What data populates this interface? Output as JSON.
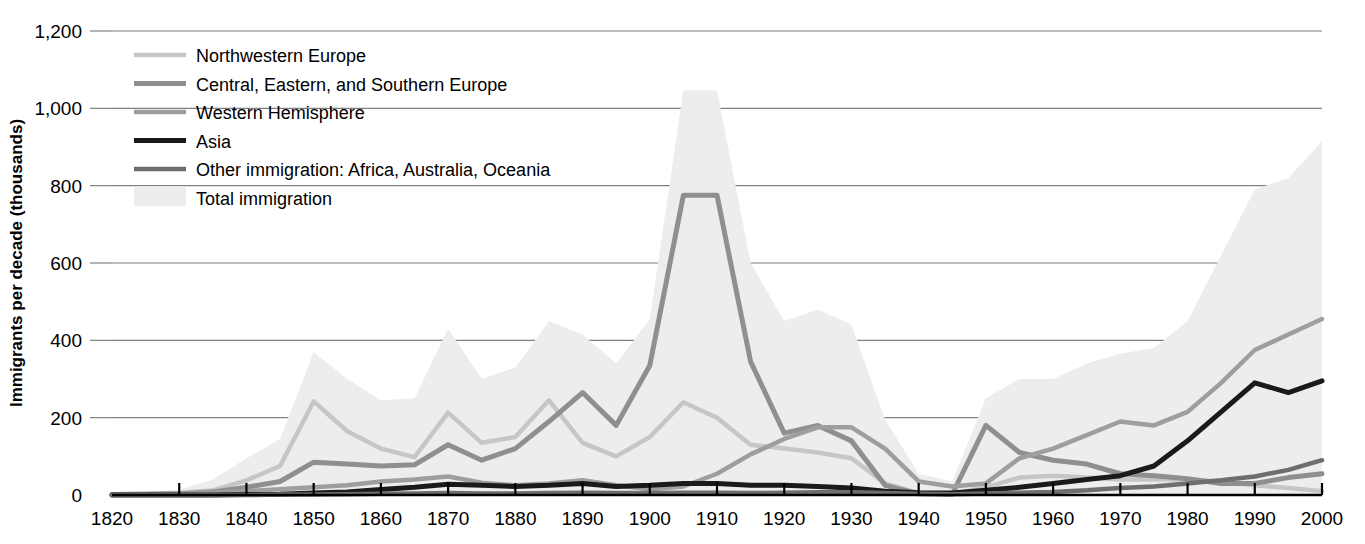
{
  "chart_data": {
    "type": "area",
    "title": "",
    "xlabel": "",
    "ylabel": "Immigrants per decade (thousands)",
    "xlim": [
      1820,
      2000
    ],
    "ylim": [
      0,
      1200
    ],
    "grid": true,
    "legend_position": "top-left",
    "xticks": [
      "1820",
      "1830",
      "1840",
      "1850",
      "1860",
      "1870",
      "1880",
      "1890",
      "1900",
      "1910",
      "1920",
      "1930",
      "1940",
      "1950",
      "1960",
      "1970",
      "1980",
      "1990",
      "2000"
    ],
    "yticks": [
      "0",
      "200",
      "400",
      "600",
      "800",
      "1,000",
      "1,200"
    ],
    "ytick_values": [
      0,
      200,
      400,
      600,
      800,
      1000,
      1200
    ],
    "x": [
      1820,
      1825,
      1830,
      1835,
      1840,
      1845,
      1850,
      1855,
      1860,
      1865,
      1870,
      1875,
      1880,
      1885,
      1890,
      1895,
      1900,
      1905,
      1910,
      1915,
      1920,
      1925,
      1930,
      1935,
      1940,
      1945,
      1950,
      1955,
      1960,
      1965,
      1970,
      1975,
      1980,
      1985,
      1990,
      1995,
      2000
    ],
    "series": [
      {
        "name": "Northwestern Europe",
        "color": "#c6c6c6",
        "width": 4.5,
        "values": [
          2,
          3,
          5,
          12,
          38,
          75,
          242,
          165,
          120,
          98,
          213,
          135,
          150,
          245,
          135,
          100,
          150,
          240,
          200,
          130,
          120,
          110,
          95,
          30,
          5,
          2,
          20,
          45,
          50,
          45,
          40,
          40,
          40,
          35,
          25,
          18,
          10
        ]
      },
      {
        "name": "Central, Eastern, and Southern Europe",
        "color": "#8f8f8f",
        "width": 5.0,
        "values": [
          1,
          2,
          3,
          8,
          20,
          35,
          85,
          80,
          75,
          78,
          130,
          90,
          120,
          190,
          265,
          180,
          335,
          775,
          775,
          345,
          160,
          180,
          140,
          25,
          3,
          2,
          180,
          110,
          90,
          80,
          55,
          50,
          42,
          30,
          30,
          45,
          55
        ]
      },
      {
        "name": "Western Hemisphere",
        "color": "#9e9e9e",
        "width": 4.5,
        "values": [
          1,
          2,
          3,
          5,
          10,
          15,
          20,
          25,
          35,
          40,
          48,
          32,
          25,
          30,
          38,
          25,
          15,
          22,
          55,
          105,
          145,
          175,
          175,
          120,
          35,
          22,
          30,
          95,
          120,
          155,
          190,
          180,
          215,
          290,
          375,
          415,
          455
        ]
      },
      {
        "name": "Asia",
        "color": "#1a1a1a",
        "width": 5.0,
        "values": [
          0,
          0,
          0,
          0,
          1,
          2,
          5,
          8,
          14,
          20,
          28,
          25,
          22,
          25,
          30,
          22,
          25,
          30,
          30,
          25,
          25,
          22,
          18,
          10,
          6,
          5,
          12,
          20,
          30,
          40,
          50,
          75,
          140,
          215,
          290,
          265,
          295
        ]
      },
      {
        "name": "Other immigration: Africa, Australia, Oceania",
        "color": "#6e6e6e",
        "width": 4.5,
        "values": [
          0,
          0,
          0,
          0,
          0,
          1,
          1,
          2,
          3,
          4,
          5,
          4,
          4,
          5,
          6,
          5,
          5,
          6,
          6,
          5,
          6,
          7,
          7,
          5,
          3,
          2,
          4,
          6,
          8,
          12,
          18,
          22,
          30,
          38,
          48,
          65,
          90
        ]
      }
    ],
    "area_series": {
      "name": "Total immigration",
      "color": "#ededed",
      "values": [
        5,
        8,
        14,
        40,
        95,
        145,
        370,
        300,
        245,
        250,
        430,
        300,
        330,
        450,
        415,
        340,
        455,
        1047,
        1047,
        600,
        450,
        480,
        440,
        195,
        55,
        35,
        250,
        300,
        300,
        340,
        365,
        380,
        450,
        620,
        790,
        820,
        915
      ]
    }
  },
  "legend": {
    "items": [
      {
        "label": "Northwestern Europe",
        "type": "line"
      },
      {
        "label": "Central, Eastern, and Southern Europe",
        "type": "line"
      },
      {
        "label": "Western Hemisphere",
        "type": "line"
      },
      {
        "label": "Asia",
        "type": "line"
      },
      {
        "label": "Other immigration: Africa, Australia, Oceania",
        "type": "line"
      },
      {
        "label": "Total immigration",
        "type": "area"
      }
    ]
  }
}
